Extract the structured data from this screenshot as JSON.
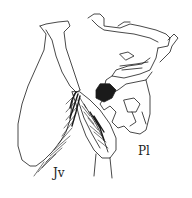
{
  "figure": {
    "type": "scientific line drawing",
    "labels": {
      "jv": "Jv",
      "pl": "Pl"
    },
    "colors": {
      "ink": "#1a1a1a",
      "background": "#ffffff"
    }
  }
}
